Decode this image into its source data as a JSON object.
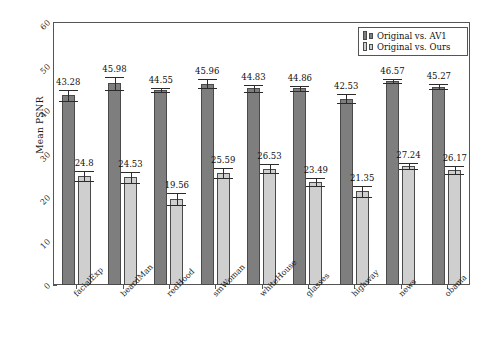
{
  "chart_data": {
    "type": "bar",
    "title": "",
    "xlabel": "",
    "ylabel": "Mean PSNR",
    "ylim": [
      0,
      60
    ],
    "yticks": [
      0,
      10,
      20,
      30,
      40,
      50,
      60
    ],
    "grid": false,
    "legend_position": "top-right",
    "categories": [
      "facialExp",
      "beardMan",
      "redHood",
      "smWoman",
      "whiteHouse",
      "glasses",
      "highway",
      "news",
      "obama"
    ],
    "series": [
      {
        "name": "Original vs. AV1",
        "color": "#7e7e7e",
        "values": [
          43.28,
          45.98,
          44.55,
          45.96,
          44.83,
          44.86,
          42.53,
          46.57,
          45.27
        ],
        "errors": [
          1.3,
          1.5,
          0.5,
          1.0,
          0.7,
          0.5,
          1.0,
          0.5,
          0.6
        ]
      },
      {
        "name": "Original vs. Ours",
        "color": "#cfcfcf",
        "values": [
          24.8,
          24.53,
          19.56,
          25.59,
          26.53,
          23.49,
          21.35,
          27.24,
          26.17
        ],
        "errors": [
          1.1,
          1.2,
          1.4,
          1.1,
          1.0,
          1.0,
          1.2,
          0.7,
          0.9
        ]
      }
    ],
    "value_labels": {
      "Original vs. AV1": [
        "43.28",
        "45.98",
        "44.55",
        "45.96",
        "44.83",
        "44.86",
        "42.53",
        "46.57",
        "45.27"
      ],
      "Original vs. Ours": [
        "24.8",
        "24.53",
        "19.56",
        "25.59",
        "26.53",
        "23.49",
        "21.35",
        "27.24",
        "26.17"
      ]
    }
  },
  "legend": {
    "entries": [
      {
        "label": "Original vs. AV1"
      },
      {
        "label": "Original vs. Ours"
      }
    ]
  },
  "axes": {
    "y_title": "Mean PSNR",
    "y_tick_labels": [
      "0",
      "10",
      "20",
      "30",
      "40",
      "50",
      "60"
    ],
    "x_tick_labels": [
      "facialExp",
      "beardMan",
      "redHood",
      "smWoman",
      "whiteHouse",
      "glasses",
      "highway",
      "news",
      "obama"
    ]
  }
}
